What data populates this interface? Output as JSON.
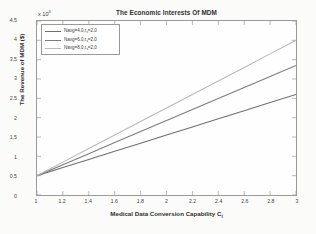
{
  "chart_data": {
    "type": "line",
    "title": "The Economic Interests Of MDM",
    "xlabel": "Medical Data Conversion Capability C",
    "xlabel_sub": "i",
    "ylabel": "The Revenue of MDM ($)",
    "y_exponent_label": "x 10",
    "y_exponent_power": "4",
    "xlim": [
      1,
      3
    ],
    "ylim": [
      0,
      45000
    ],
    "xticks": [
      "1",
      "1.2",
      "1.4",
      "1.6",
      "1.8",
      "2",
      "2.2",
      "2.4",
      "2.6",
      "2.8",
      "3"
    ],
    "xtick_values": [
      1,
      1.2,
      1.4,
      1.6,
      1.8,
      2,
      2.2,
      2.4,
      2.6,
      2.8,
      3
    ],
    "yticks": [
      "0",
      "0.5",
      "1",
      "1.5",
      "2",
      "2.5",
      "3",
      "3.5",
      "4",
      "4.5"
    ],
    "ytick_values": [
      0,
      5000,
      10000,
      15000,
      20000,
      25000,
      30000,
      35000,
      40000,
      45000
    ],
    "grid": false,
    "legend_position": "top-left",
    "x": [
      1,
      1.2,
      1.4,
      1.6,
      1.8,
      2,
      2.2,
      2.4,
      2.6,
      2.8,
      3
    ],
    "series": [
      {
        "name": "Navg=4.0,r",
        "name_sub": "s",
        "name_tail": "=2.0",
        "color": "#6f6f72",
        "values": [
          5000,
          7100,
          9200,
          11300,
          13400,
          15500,
          17600,
          19700,
          21800,
          23900,
          26000
        ]
      },
      {
        "name": "Navg=6.0,r",
        "name_sub": "s",
        "name_tail": "=2.0",
        "color": "#7d7d80",
        "values": [
          5000,
          7850,
          10700,
          13550,
          16400,
          19250,
          22100,
          24950,
          27800,
          30650,
          33500
        ]
      },
      {
        "name": "Navg=8.0,r",
        "name_sub": "s",
        "name_tail": "=2.0",
        "color": "#b9b9bc",
        "values": [
          5000,
          8500,
          12000,
          15500,
          19000,
          22500,
          26000,
          29500,
          33000,
          36500,
          40000
        ]
      }
    ]
  }
}
